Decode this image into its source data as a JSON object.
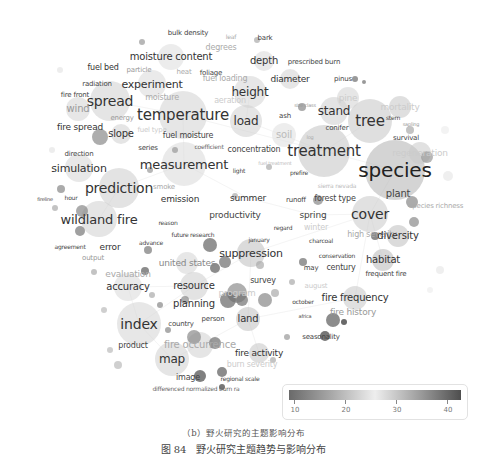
{
  "figure": {
    "subcaption": "（b）野火研究的主题影响分布",
    "caption": "图 84　野火研究主题趋势与影响分布"
  },
  "legend": {
    "ticks": [
      "10",
      "20",
      "30",
      "40"
    ],
    "gradient": [
      "#6a6a6a",
      "#eeeeee",
      "#4e4e4e"
    ]
  },
  "chart_data": {
    "type": "scatter",
    "title": "",
    "subtitle": "（b）野火研究的主题影响分布",
    "xlabel": "",
    "ylabel": "",
    "grid": false,
    "legend_position": "bottom-right",
    "color_scale": {
      "label": "average citations",
      "range": [
        10,
        40
      ],
      "ticks": [
        10,
        20,
        30,
        40
      ]
    },
    "keywords": [
      {
        "label": "species",
        "x": 395,
        "y": 170,
        "size": 20,
        "color": "#222"
      },
      {
        "label": "treatment",
        "x": 324,
        "y": 151,
        "size": 15,
        "color": "#333"
      },
      {
        "label": "temperature",
        "x": 183,
        "y": 115,
        "size": 15,
        "color": "#333"
      },
      {
        "label": "measurement",
        "x": 184,
        "y": 164,
        "size": 13,
        "color": "#333"
      },
      {
        "label": "tree",
        "x": 370,
        "y": 121,
        "size": 15,
        "color": "#333"
      },
      {
        "label": "index",
        "x": 139,
        "y": 324,
        "size": 14,
        "color": "#333"
      },
      {
        "label": "spread",
        "x": 110,
        "y": 101,
        "size": 14,
        "color": "#333"
      },
      {
        "label": "prediction",
        "x": 119,
        "y": 188,
        "size": 14,
        "color": "#333"
      },
      {
        "label": "wildland fire",
        "x": 99,
        "y": 219,
        "size": 13,
        "color": "#333"
      },
      {
        "label": "cover",
        "x": 370,
        "y": 214,
        "size": 14,
        "color": "#333"
      },
      {
        "label": "stand",
        "x": 334,
        "y": 111,
        "size": 12,
        "color": "#333"
      },
      {
        "label": "height",
        "x": 250,
        "y": 92,
        "size": 12,
        "color": "#333"
      },
      {
        "label": "load",
        "x": 246,
        "y": 121,
        "size": 12,
        "color": "#333"
      },
      {
        "label": "map",
        "x": 172,
        "y": 359,
        "size": 12,
        "color": "#333"
      },
      {
        "label": "suppression",
        "x": 251,
        "y": 253,
        "size": 11,
        "color": "#333"
      },
      {
        "label": "fire frequency",
        "x": 355,
        "y": 298,
        "size": 10,
        "color": "#333"
      },
      {
        "label": "fire history",
        "x": 353,
        "y": 312,
        "size": 9,
        "color": "#999"
      },
      {
        "label": "resource",
        "x": 194,
        "y": 286,
        "size": 10,
        "color": "#333"
      },
      {
        "label": "planning",
        "x": 194,
        "y": 304,
        "size": 10,
        "color": "#333"
      },
      {
        "label": "accuracy",
        "x": 128,
        "y": 287,
        "size": 10,
        "color": "#333"
      },
      {
        "label": "united states",
        "x": 187,
        "y": 263,
        "size": 9,
        "color": "#888"
      },
      {
        "label": "evaluation",
        "x": 128,
        "y": 274,
        "size": 9,
        "color": "#aaa"
      },
      {
        "label": "simulation",
        "x": 79,
        "y": 168,
        "size": 11,
        "color": "#333"
      },
      {
        "label": "experiment",
        "x": 152,
        "y": 84,
        "size": 11,
        "color": "#333"
      },
      {
        "label": "moisture content",
        "x": 171,
        "y": 57,
        "size": 10,
        "color": "#333"
      },
      {
        "label": "fuel bed",
        "x": 103,
        "y": 68,
        "size": 8,
        "color": "#333"
      },
      {
        "label": "particle",
        "x": 139,
        "y": 70,
        "size": 7,
        "color": "#999"
      },
      {
        "label": "heat",
        "x": 184,
        "y": 72,
        "size": 7,
        "color": "#aaa"
      },
      {
        "label": "foliage",
        "x": 211,
        "y": 73,
        "size": 7,
        "color": "#444"
      },
      {
        "label": "degrees",
        "x": 221,
        "y": 48,
        "size": 8,
        "color": "#aaa"
      },
      {
        "label": "bulk density",
        "x": 188,
        "y": 33,
        "size": 7,
        "color": "#444"
      },
      {
        "label": "bark",
        "x": 265,
        "y": 38,
        "size": 7,
        "color": "#444"
      },
      {
        "label": "leaf",
        "x": 231,
        "y": 37,
        "size": 6,
        "color": "#aaa"
      },
      {
        "label": "depth",
        "x": 264,
        "y": 61,
        "size": 10,
        "color": "#333"
      },
      {
        "label": "prescribed burn",
        "x": 314,
        "y": 62,
        "size": 7,
        "color": "#444"
      },
      {
        "label": "diameter",
        "x": 290,
        "y": 79,
        "size": 9,
        "color": "#333"
      },
      {
        "label": "fuel loading",
        "x": 225,
        "y": 79,
        "size": 8,
        "color": "#aaa"
      },
      {
        "label": "pinus",
        "x": 343,
        "y": 79,
        "size": 7,
        "color": "#444"
      },
      {
        "label": "pine",
        "x": 348,
        "y": 98,
        "size": 9,
        "color": "#ccc"
      },
      {
        "label": "mortality",
        "x": 400,
        "y": 107,
        "size": 9,
        "color": "#ccc"
      },
      {
        "label": "radiation",
        "x": 97,
        "y": 84,
        "size": 7,
        "color": "#444"
      },
      {
        "label": "fire front",
        "x": 75,
        "y": 95,
        "size": 7,
        "color": "#444"
      },
      {
        "label": "moisture",
        "x": 162,
        "y": 98,
        "size": 8,
        "color": "#aaa"
      },
      {
        "label": "aeration",
        "x": 230,
        "y": 101,
        "size": 8,
        "color": "#ccc"
      },
      {
        "label": "wind",
        "x": 78,
        "y": 109,
        "size": 10,
        "color": "#999"
      },
      {
        "label": "energy",
        "x": 122,
        "y": 118,
        "size": 7,
        "color": "#999"
      },
      {
        "label": "fire spread",
        "x": 80,
        "y": 127,
        "size": 9,
        "color": "#333"
      },
      {
        "label": "slope",
        "x": 121,
        "y": 134,
        "size": 10,
        "color": "#333"
      },
      {
        "label": "fuel type",
        "x": 152,
        "y": 130,
        "size": 7,
        "color": "#ccc"
      },
      {
        "label": "fuel moisture",
        "x": 188,
        "y": 136,
        "size": 8,
        "color": "#444"
      },
      {
        "label": "series",
        "x": 148,
        "y": 148,
        "size": 7,
        "color": "#444"
      },
      {
        "label": "coefficient",
        "x": 209,
        "y": 147,
        "size": 6,
        "color": "#666"
      },
      {
        "label": "concentration",
        "x": 254,
        "y": 150,
        "size": 8,
        "color": "#444"
      },
      {
        "label": "direction",
        "x": 79,
        "y": 154,
        "size": 7,
        "color": "#444"
      },
      {
        "label": "light",
        "x": 239,
        "y": 171,
        "size": 6,
        "color": "#444"
      },
      {
        "label": "ash",
        "x": 285,
        "y": 116,
        "size": 7,
        "color": "#444"
      },
      {
        "label": "size class",
        "x": 305,
        "y": 105,
        "size": 5,
        "color": "#999"
      },
      {
        "label": "soil",
        "x": 284,
        "y": 135,
        "size": 10,
        "color": "#bbb"
      },
      {
        "label": "conifer",
        "x": 337,
        "y": 128,
        "size": 7,
        "color": "#444"
      },
      {
        "label": "log",
        "x": 310,
        "y": 137,
        "size": 5,
        "color": "#aaa"
      },
      {
        "label": "stem",
        "x": 393,
        "y": 118,
        "size": 6,
        "color": "#444"
      },
      {
        "label": "sapling",
        "x": 411,
        "y": 124,
        "size": 5,
        "color": "#999"
      },
      {
        "label": "survival",
        "x": 406,
        "y": 138,
        "size": 7,
        "color": "#444"
      },
      {
        "label": "regeneration",
        "x": 420,
        "y": 153,
        "size": 9,
        "color": "#ccc"
      },
      {
        "label": "fuel treatment",
        "x": 275,
        "y": 163,
        "size": 5,
        "color": "#bbb"
      },
      {
        "label": "prefire",
        "x": 299,
        "y": 173,
        "size": 6,
        "color": "#444"
      },
      {
        "label": "smoke",
        "x": 164,
        "y": 187,
        "size": 7,
        "color": "#aaa"
      },
      {
        "label": "emission",
        "x": 180,
        "y": 199,
        "size": 9,
        "color": "#333"
      },
      {
        "label": "hour",
        "x": 71,
        "y": 198,
        "size": 6,
        "color": "#444"
      },
      {
        "label": "fireline",
        "x": 45,
        "y": 199,
        "size": 5,
        "color": "#444"
      },
      {
        "label": "summer",
        "x": 248,
        "y": 198,
        "size": 9,
        "color": "#333"
      },
      {
        "label": "runoff",
        "x": 296,
        "y": 200,
        "size": 7,
        "color": "#444"
      },
      {
        "label": "forest type",
        "x": 335,
        "y": 199,
        "size": 8,
        "color": "#444"
      },
      {
        "label": "sierra nevada",
        "x": 337,
        "y": 186,
        "size": 6,
        "color": "#bbb"
      },
      {
        "label": "plant",
        "x": 398,
        "y": 194,
        "size": 10,
        "color": "#444"
      },
      {
        "label": "species richness",
        "x": 436,
        "y": 206,
        "size": 7,
        "color": "#aaa"
      },
      {
        "label": "productivity",
        "x": 235,
        "y": 215,
        "size": 9,
        "color": "#444"
      },
      {
        "label": "spring",
        "x": 313,
        "y": 215,
        "size": 9,
        "color": "#444"
      },
      {
        "label": "regard",
        "x": 283,
        "y": 228,
        "size": 6,
        "color": "#444"
      },
      {
        "label": "winter",
        "x": 316,
        "y": 228,
        "size": 8,
        "color": "#ccc"
      },
      {
        "label": "reason",
        "x": 168,
        "y": 223,
        "size": 6,
        "color": "#444"
      },
      {
        "label": "future research",
        "x": 193,
        "y": 235,
        "size": 6,
        "color": "#444"
      },
      {
        "label": "january",
        "x": 259,
        "y": 240,
        "size": 6,
        "color": "#444"
      },
      {
        "label": "charcoal",
        "x": 321,
        "y": 241,
        "size": 6,
        "color": "#444"
      },
      {
        "label": "high severity",
        "x": 372,
        "y": 235,
        "size": 8,
        "color": "#aaa"
      },
      {
        "label": "diversity",
        "x": 398,
        "y": 236,
        "size": 10,
        "color": "#333"
      },
      {
        "label": "agreement",
        "x": 70,
        "y": 247,
        "size": 6,
        "color": "#444"
      },
      {
        "label": "error",
        "x": 110,
        "y": 247,
        "size": 9,
        "color": "#333"
      },
      {
        "label": "advance",
        "x": 151,
        "y": 243,
        "size": 6,
        "color": "#444"
      },
      {
        "label": "output",
        "x": 93,
        "y": 258,
        "size": 7,
        "color": "#999"
      },
      {
        "label": "conservation",
        "x": 337,
        "y": 256,
        "size": 6,
        "color": "#444"
      },
      {
        "label": "habitat",
        "x": 383,
        "y": 260,
        "size": 10,
        "color": "#333"
      },
      {
        "label": "may",
        "x": 311,
        "y": 268,
        "size": 7,
        "color": "#444"
      },
      {
        "label": "century",
        "x": 341,
        "y": 268,
        "size": 8,
        "color": "#444"
      },
      {
        "label": "frequent fire",
        "x": 386,
        "y": 274,
        "size": 7,
        "color": "#444"
      },
      {
        "label": "survey",
        "x": 263,
        "y": 281,
        "size": 8,
        "color": "#444"
      },
      {
        "label": "program",
        "x": 237,
        "y": 293,
        "size": 9,
        "color": "#ccc"
      },
      {
        "label": "august",
        "x": 316,
        "y": 286,
        "size": 7,
        "color": "#ccc"
      },
      {
        "label": "october",
        "x": 303,
        "y": 302,
        "size": 6,
        "color": "#444"
      },
      {
        "label": "person",
        "x": 213,
        "y": 319,
        "size": 7,
        "color": "#444"
      },
      {
        "label": "land",
        "x": 248,
        "y": 319,
        "size": 10,
        "color": "#333"
      },
      {
        "label": "country",
        "x": 181,
        "y": 324,
        "size": 7,
        "color": "#444"
      },
      {
        "label": "africa",
        "x": 305,
        "y": 316,
        "size": 5,
        "color": "#444"
      },
      {
        "label": "seasonality",
        "x": 321,
        "y": 337,
        "size": 7,
        "color": "#444"
      },
      {
        "label": "product",
        "x": 133,
        "y": 346,
        "size": 8,
        "color": "#444"
      },
      {
        "label": "fire occurrence",
        "x": 200,
        "y": 345,
        "size": 10,
        "color": "#aaa"
      },
      {
        "label": "fire activity",
        "x": 259,
        "y": 353,
        "size": 9,
        "color": "#333"
      },
      {
        "label": "burn severity",
        "x": 252,
        "y": 365,
        "size": 8,
        "color": "#ccc"
      },
      {
        "label": "image",
        "x": 188,
        "y": 378,
        "size": 8,
        "color": "#444"
      },
      {
        "label": "regional scale",
        "x": 240,
        "y": 379,
        "size": 6,
        "color": "#444"
      },
      {
        "label": "differenced normalized burn ra",
        "x": 196,
        "y": 389,
        "size": 6,
        "color": "#666"
      }
    ]
  }
}
